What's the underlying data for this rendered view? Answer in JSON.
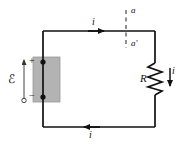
{
  "figure": {
    "type": "circuit-diagram",
    "background_color": "#ffffff",
    "wire_color": "#111111",
    "battery_fill_color": "#b3b3b3",
    "battery_stroke_color": "#999999"
  },
  "labels": {
    "current_top": "i",
    "current_bottom": "i",
    "current_resistor": "i",
    "resistor": "R",
    "emf": "ℰ",
    "node_a": "a",
    "node_a_prime": "a′",
    "terminal_positive": "+",
    "terminal_negative": "−"
  },
  "elements": {
    "loop": {
      "name": "circuit-loop",
      "left_x": 43,
      "right_x": 155,
      "top_y": 31,
      "bottom_y": 127
    },
    "battery": {
      "name": "emf-source",
      "x": 33,
      "y": 57,
      "width": 27,
      "height": 45,
      "terminal_top_y": 62,
      "terminal_bottom_y": 97
    },
    "resistor": {
      "name": "resistor",
      "center_x": 155,
      "top_y": 63,
      "bottom_y": 95,
      "zigzag_amplitude": 7,
      "segments": 6
    },
    "section_line": {
      "name": "cross-section-aa",
      "x": 126,
      "top_y": 10,
      "bottom_y": 48,
      "style": "dashed"
    },
    "arrows": {
      "top_current": {
        "x_start": 88,
        "x_end": 108,
        "y": 31,
        "direction": "right"
      },
      "bottom_current": {
        "x_start": 100,
        "x_end": 80,
        "y": 127,
        "direction": "left"
      },
      "resistor_current": {
        "x": 170,
        "y_start": 68,
        "y_end": 90,
        "direction": "down"
      },
      "emf_potential": {
        "x": 24,
        "y_start": 100,
        "y_end": 57,
        "direction": "up"
      }
    }
  }
}
